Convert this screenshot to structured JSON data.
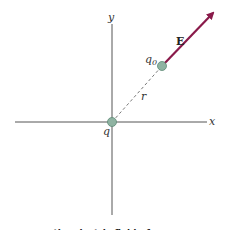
{
  "diagram": {
    "axes": {
      "x_label": "x",
      "y_label": "y"
    },
    "source_charge": {
      "label": "q"
    },
    "test_charge": {
      "label_main": "q",
      "label_sub": "0"
    },
    "distance_label": "r",
    "field_vector_label": "E",
    "colors": {
      "axis": "#555555",
      "charge_fill": "#8fb3a2",
      "charge_stroke": "#5e8a76",
      "vector": "#8a1a4a"
    },
    "caption_fragment": "... the electric field of ..."
  }
}
